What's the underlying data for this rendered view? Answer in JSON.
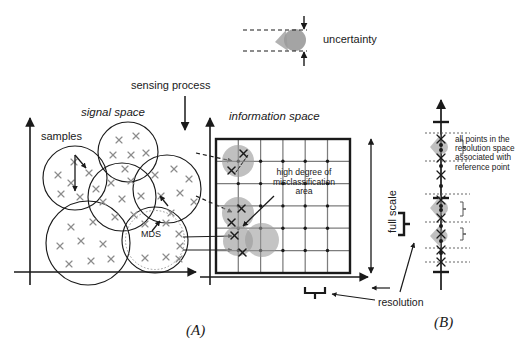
{
  "figure": {
    "caption_a": "(A)",
    "caption_b": "(B)"
  },
  "labels": {
    "uncertainty": "uncertainty",
    "sensing_process": "sensing process",
    "signal_space": "signal space",
    "information_space": "information space",
    "samples": "samples",
    "mds": "MDS",
    "misclassification": "high degree of misclassification area",
    "misclassification_l1": "high degree of",
    "misclassification_l2": "misclassification",
    "misclassification_l3": "area",
    "full_scale": "full scale",
    "resolution": "resolution",
    "reference_note": "all points in the resolution space associated with reference point",
    "reference_note_l1": "all points in the",
    "reference_note_l2": "resolution space",
    "reference_note_l3": "associated with",
    "reference_note_l4": "reference point"
  },
  "colors": {
    "ink": "#1a1a1a",
    "blob_gray": "#9a9a9a",
    "grid_gray": "#7d7d7d",
    "x_mark_gray": "#8c8c8c",
    "background": "#ffffff"
  },
  "diagram_data": {
    "type": "schematic-diagram",
    "panels": [
      {
        "id": "A",
        "name": "signal-to-information mapping",
        "caption": "(A)"
      },
      {
        "id": "B",
        "name": "resolution space axis",
        "caption": "(B)"
      }
    ],
    "signal_space": {
      "axis_origin": [
        30,
        272
      ],
      "circles": [
        {
          "cx": 75,
          "cy": 178,
          "r": 32,
          "label": ""
        },
        {
          "cx": 128,
          "cy": 152,
          "r": 30,
          "label": ""
        },
        {
          "cx": 122,
          "cy": 197,
          "r": 34,
          "label": ""
        },
        {
          "cx": 167,
          "cy": 189,
          "r": 34,
          "label": ""
        },
        {
          "cx": 88,
          "cy": 243,
          "r": 42,
          "label": ""
        },
        {
          "cx": 155,
          "cy": 240,
          "r": 33,
          "label": "MDS",
          "inner_dotted": true
        }
      ],
      "sample_marks_per_circle": 8,
      "sample_glyph": "x"
    },
    "information_space": {
      "box": [
        216,
        139,
        134,
        134
      ],
      "grid_cells_x": 6,
      "grid_cells_y": 6,
      "node_dots": true,
      "blobs": [
        {
          "cx": 238,
          "cy": 161,
          "r": 16
        },
        {
          "cx": 238,
          "cy": 213,
          "r": 16
        },
        {
          "cx": 238,
          "cy": 241,
          "r": 15
        },
        {
          "cx": 262,
          "cy": 240,
          "r": 17
        }
      ],
      "x_marks": [
        [
          243,
          153
        ],
        [
          231,
          170
        ],
        [
          241,
          208
        ],
        [
          231,
          222
        ],
        [
          234,
          235
        ],
        [
          242,
          252
        ]
      ]
    },
    "resolution_space": {
      "axis_x": 441,
      "axis_top": 100,
      "axis_bottom": 285,
      "scale_ticks": [
        122,
        198,
        272
      ],
      "blobs": [
        {
          "cy": 147,
          "h": 26
        },
        {
          "cy": 208,
          "h": 26
        },
        {
          "cy": 236,
          "h": 24
        }
      ],
      "point_clusters": [
        {
          "cy": 140,
          "count": 6
        },
        {
          "cy": 205,
          "count": 6
        },
        {
          "cy": 234,
          "count": 5
        }
      ]
    },
    "uncertainty_detail": {
      "band_top": 30,
      "band_bottom": 51,
      "blob_cx": 293,
      "label": "uncertainty"
    }
  }
}
